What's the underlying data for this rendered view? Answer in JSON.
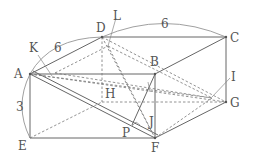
{
  "diagram": {
    "type": "rectangular-prism",
    "vertices": {
      "A": {
        "label": "A",
        "x": 30,
        "y": 74
      },
      "B": {
        "label": "B",
        "x": 155,
        "y": 74
      },
      "C": {
        "label": "C",
        "x": 226,
        "y": 37
      },
      "D": {
        "label": "D",
        "x": 102,
        "y": 37
      },
      "E": {
        "label": "E",
        "x": 30,
        "y": 138
      },
      "F": {
        "label": "F",
        "x": 155,
        "y": 138
      },
      "G": {
        "label": "G",
        "x": 226,
        "y": 102
      },
      "H": {
        "label": "H",
        "x": 102,
        "y": 102
      }
    },
    "points": {
      "I": {
        "label": "I"
      },
      "J": {
        "label": "J"
      },
      "K": {
        "label": "K"
      },
      "L": {
        "label": "L"
      },
      "P": {
        "label": "P"
      }
    },
    "dimensions": {
      "AD": "6",
      "DC": "6",
      "AE": "3"
    }
  }
}
